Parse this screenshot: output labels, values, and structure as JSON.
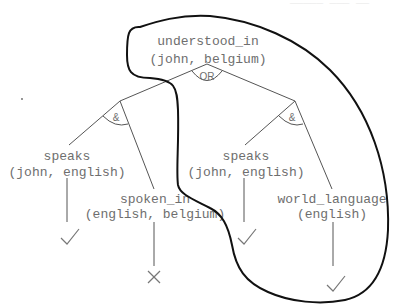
{
  "header": {
    "cut_text": "_____ ___ __"
  },
  "root": {
    "predicate": "understood_in",
    "args": "(john, belgium)",
    "connector": "OR"
  },
  "left_branch": {
    "connector": "&",
    "children": [
      {
        "predicate": "speaks",
        "args": "(john, english)",
        "result": "check"
      },
      {
        "predicate": "spoken_in",
        "args": "(english, belgium)",
        "result": "cross"
      }
    ]
  },
  "right_branch": {
    "connector": "&",
    "children": [
      {
        "predicate": "speaks",
        "args": "(john, english)",
        "result": "check"
      },
      {
        "predicate": "world_language",
        "args": "(english)",
        "result": "check"
      }
    ]
  },
  "highlight": {
    "description": "closed curve enclosing successful proof path",
    "color": "#111111"
  }
}
